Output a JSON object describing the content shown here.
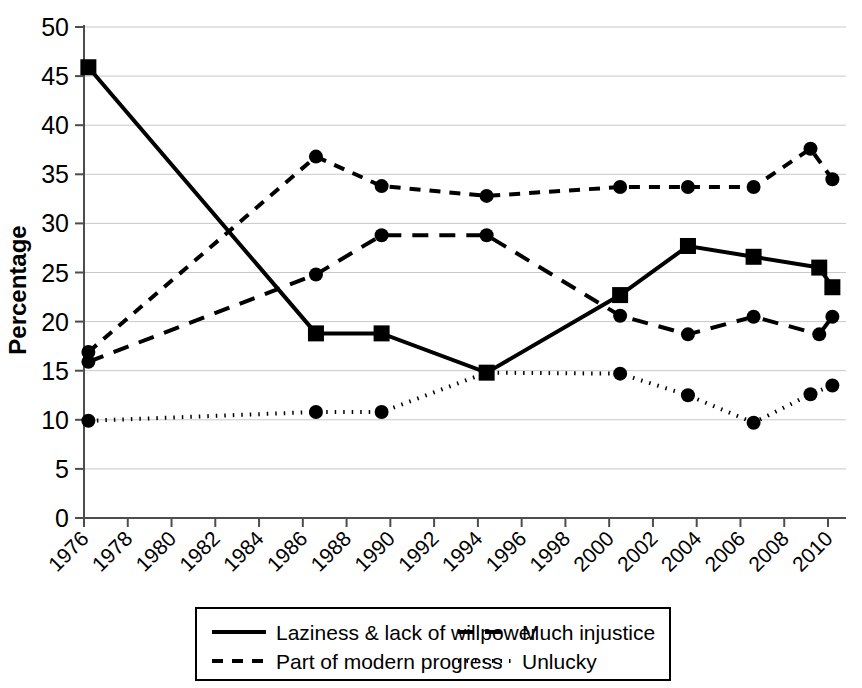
{
  "chart_data": {
    "type": "line",
    "title": "",
    "xlabel": "",
    "ylabel": "Percentage",
    "ylim": [
      0,
      50
    ],
    "xlim": [
      1976,
      2010
    ],
    "ytick_labels": [
      "0",
      "5",
      "10",
      "15",
      "20",
      "25",
      "30",
      "35",
      "40",
      "45",
      "50"
    ],
    "ytick_values": [
      0,
      5,
      10,
      15,
      20,
      25,
      30,
      35,
      40,
      45,
      50
    ],
    "xtick_labels": [
      "1976",
      "1978",
      "1980",
      "1982",
      "1984",
      "1986",
      "1988",
      "1990",
      "1992",
      "1994",
      "1996",
      "1998",
      "2000",
      "2002",
      "2004",
      "2006",
      "2008",
      "2010"
    ],
    "xtick_values": [
      1976,
      1978,
      1980,
      1982,
      1984,
      1986,
      1988,
      1990,
      1992,
      1994,
      1996,
      1998,
      2000,
      2002,
      2004,
      2006,
      2008,
      2010
    ],
    "grid": true,
    "legend_position": "bottom",
    "series": [
      {
        "name": "Laziness & lack of willpower",
        "style": "solid",
        "marker": "square",
        "x": [
          1976.2,
          1986.6,
          1989.6,
          1994.4,
          2000.5,
          2003.6,
          2006.6,
          2009.6
        ],
        "values": [
          45.9,
          18.8,
          18.8,
          14.8,
          22.7,
          27.7,
          26.6,
          25.5
        ]
      },
      {
        "name": "Much injustice",
        "style": "dashed-long",
        "marker": "circle",
        "x": [
          1976.2,
          1986.6,
          1989.6,
          1994.4,
          2000.5,
          2003.6,
          2006.6,
          2009.6
        ],
        "values": [
          15.9,
          24.8,
          28.8,
          28.8,
          20.6,
          18.7,
          20.5,
          18.7
        ]
      },
      {
        "name": "Part of modern progress",
        "style": "dashed-short",
        "marker": "circle",
        "x": [
          1976.2,
          1986.6,
          1989.6,
          1994.4,
          2000.5,
          2003.6,
          2006.6,
          2009.2,
          2010.2
        ],
        "values": [
          16.9,
          36.8,
          33.8,
          32.8,
          33.7,
          33.7,
          33.7,
          37.6,
          34.5
        ]
      },
      {
        "name": "Unlucky",
        "style": "dotted",
        "marker": "circle",
        "x": [
          1976.2,
          1986.6,
          1989.6,
          1994.4,
          2000.5,
          2003.6,
          2006.6,
          2009.2,
          2010.2
        ],
        "values": [
          9.9,
          10.8,
          10.8,
          14.8,
          14.7,
          12.5,
          9.7,
          12.6,
          13.5
        ]
      }
    ],
    "extra_points": [
      {
        "series": "Much injustice",
        "x": 2010.2,
        "value": 20.5
      },
      {
        "series": "Laziness & lack of willpower",
        "x": 2010.2,
        "value": 23.5
      }
    ],
    "legend": [
      {
        "label": "Laziness & lack of willpower",
        "style": "solid"
      },
      {
        "label": "Much injustice",
        "style": "dashed-long"
      },
      {
        "label": "Part of modern progress",
        "style": "dashed-short"
      },
      {
        "label": "Unlucky",
        "style": "dotted"
      }
    ]
  }
}
